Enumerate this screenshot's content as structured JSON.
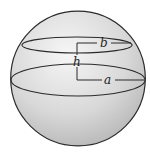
{
  "diagram": {
    "labels": {
      "top_radius": "b",
      "height": "h",
      "bottom_radius": "a"
    },
    "colors": {
      "outline": "#2a2a2a",
      "fill_light": "#f4f4f4",
      "fill_dark": "#b9b9b9"
    }
  }
}
